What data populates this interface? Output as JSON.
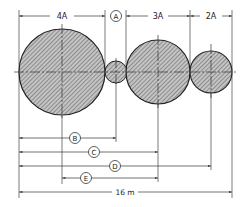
{
  "diagram": {
    "type": "engineering-dimension-drawing",
    "colors": {
      "line": "#333333",
      "hatch": "#555555",
      "fill": "#bdbdbd",
      "background": "#ffffff"
    },
    "circles": [
      {
        "id": "c1",
        "cx": 62,
        "cy": 72,
        "r": 43,
        "label": "4A"
      },
      {
        "id": "c2",
        "cx": 116,
        "cy": 72,
        "r": 11,
        "label": "A"
      },
      {
        "id": "c3",
        "cx": 158,
        "cy": 72,
        "r": 32,
        "label": "3A"
      },
      {
        "id": "c4",
        "cx": 211,
        "cy": 72,
        "r": 21,
        "label": "2A"
      }
    ],
    "top_dimensions": [
      {
        "label": "4A",
        "x1": 19,
        "x2": 105
      },
      {
        "label": "A",
        "circled": true,
        "x1": 105,
        "x2": 126
      },
      {
        "label": "3A",
        "x1": 126,
        "x2": 190
      },
      {
        "label": "2A",
        "x1": 190,
        "x2": 232
      }
    ],
    "bottom_dimensions": [
      {
        "label": "B",
        "circled": true,
        "x1": 19,
        "x2": 116,
        "y": 138
      },
      {
        "label": "C",
        "circled": true,
        "x1": 19,
        "x2": 158,
        "y": 152
      },
      {
        "label": "D",
        "circled": true,
        "x1": 19,
        "x2": 211,
        "y": 166
      },
      {
        "label": "E",
        "circled": true,
        "x1": 62,
        "x2": 158,
        "y": 178
      }
    ],
    "total_dimension": {
      "label": "16 m",
      "x1": 19,
      "x2": 232,
      "y": 192
    }
  }
}
